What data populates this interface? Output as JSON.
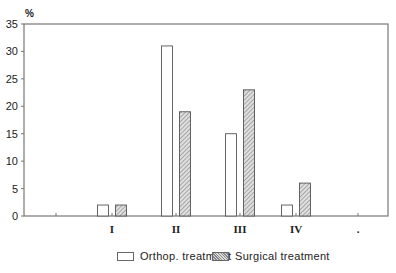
{
  "chart_data": {
    "type": "bar",
    "title": "",
    "xlabel": "",
    "ylabel": "%",
    "ylim": [
      0,
      35
    ],
    "yticks": [
      0,
      5,
      10,
      15,
      20,
      25,
      30,
      35
    ],
    "categories": [
      "I",
      "II",
      "III",
      "IV",
      "."
    ],
    "series": [
      {
        "name": "Orthop. treatment",
        "values": [
          2,
          31,
          15,
          2,
          null
        ],
        "fill": "plain"
      },
      {
        "name": "Surgical treatment",
        "values": [
          2,
          19,
          23,
          6,
          null
        ],
        "fill": "hatched"
      }
    ],
    "grid": false,
    "legend_position": "bottom"
  },
  "legend": {
    "items": [
      {
        "label": "Orthop. treatment"
      },
      {
        "label": "Surgical treatment"
      }
    ]
  },
  "colors": {
    "axis": "#777777",
    "bar_outline": "#555555",
    "hatch_dark": "#888888",
    "hatch_light": "#dddddd"
  }
}
